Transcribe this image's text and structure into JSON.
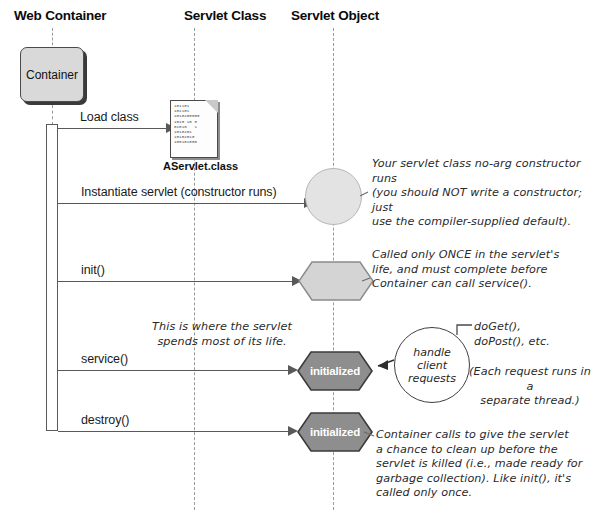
{
  "columns": [
    {
      "label": "Web Container",
      "x": 14,
      "lifeline_x": 52
    },
    {
      "label": "Servlet Class",
      "x": 184,
      "lifeline_x": 194
    },
    {
      "label": "Servlet Object",
      "x": 291,
      "lifeline_x": 333
    }
  ],
  "container_box": {
    "label": "Container"
  },
  "class_file": {
    "label": "AServlet.class",
    "bits": "101101\n101101\n1010100000\n1010 10 0\n01010   1\n1010101\n10101010\n100101000"
  },
  "messages": [
    {
      "label": "Load class"
    },
    {
      "label": "Instantiate servlet (constructor runs)"
    },
    {
      "label": "init()"
    },
    {
      "label": "service()"
    },
    {
      "label": "destroy()"
    }
  ],
  "object_states": [
    {
      "name": "instantiated",
      "label": ""
    },
    {
      "name": "init",
      "label": ""
    },
    {
      "name": "service",
      "label": "initialized"
    },
    {
      "name": "destroy",
      "label": "initialized"
    }
  ],
  "notes": {
    "constructor": "Your servlet class no-arg constructor runs\n(you should NOT write a constructor; just\nuse the compiler-supplied default).",
    "init": "Called only ONCE in the servlet's\nlife, and must complete before\nContainer can call service().",
    "service_life": "This is where the servlet\nspends most of its life.",
    "do_methods": "doGet(),\ndoPost(), etc.",
    "thread": "(Each request runs in a\nseparate thread.)",
    "destroy": "Container calls to give the servlet\na chance to clean up before the\nservlet is killed (i.e., made ready for\ngarbage collection). Like init(), it's\ncalled only once."
  },
  "bubble": {
    "text": "handle\nclient\nrequests"
  },
  "colors": {
    "line": "#595959",
    "lifeline": "#9a9a9a",
    "container_fill": "#d9d9d9",
    "hex_light": "#d4d4d4",
    "hex_dark": "#8e8e8e",
    "circle_fill": "#e3e3e3",
    "text": "#1a1a1a"
  }
}
